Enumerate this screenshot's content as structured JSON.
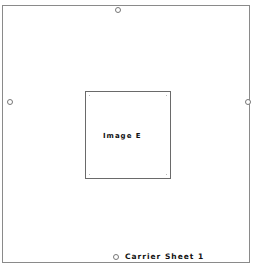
{
  "diagram": {
    "inner_box": {
      "label": "Image E"
    },
    "footer": {
      "label": "Carrier Sheet 1"
    },
    "registration_holes": [
      "top",
      "left",
      "right",
      "bottom"
    ],
    "colors": {
      "border": "#8a8a8a",
      "text": "#111111",
      "background": "#ffffff"
    }
  }
}
